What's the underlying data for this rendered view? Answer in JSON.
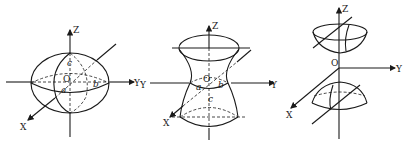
{
  "figures": [
    {
      "name": "ellipsoid",
      "axis_labels": {
        "x": "X",
        "y": "Y",
        "z": "Z",
        "origin": "O"
      },
      "semi_axis_labels": {
        "a": "a",
        "b": "b",
        "c": "c"
      }
    },
    {
      "name": "hyperboloid-of-one-sheet",
      "axis_labels": {
        "x": "X",
        "y": "Y",
        "y_neg": "Y",
        "z": "Z",
        "origin": "O"
      },
      "semi_axis_labels": {
        "a": "a",
        "b": "b",
        "c": "c"
      }
    },
    {
      "name": "hyperboloid-of-two-sheets",
      "axis_labels": {
        "x": "X",
        "y": "Y",
        "z": "Z",
        "origin": "O"
      }
    }
  ],
  "colors": {
    "stroke": "#1a1a1a",
    "background": "#ffffff"
  }
}
